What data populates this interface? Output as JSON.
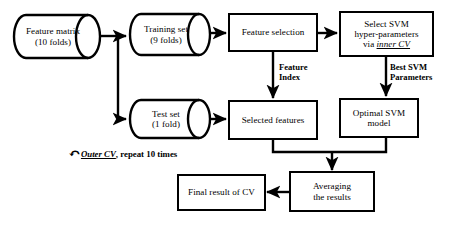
{
  "diagram": {
    "stroke_color": "#000000",
    "background_color": "#ffffff",
    "nodes": {
      "feature_matrix": {
        "line1": "Feature matrix",
        "line2": "(10 folds)",
        "shape": "cylinder"
      },
      "training_set": {
        "line1": "Training set",
        "line2": "(9 folds)",
        "shape": "cylinder"
      },
      "test_set": {
        "line1": "Test set",
        "line2": "(1 fold)",
        "shape": "cylinder"
      },
      "feature_selection": {
        "line1": "Feature selection",
        "shape": "rectangle"
      },
      "select_svm": {
        "line1": "Select SVM",
        "line2": "hyper-parameters",
        "line3_prefix": "via ",
        "line3_emphasis": "inner CV",
        "shape": "rectangle"
      },
      "selected_features": {
        "line1": "Selected  features",
        "shape": "rectangle"
      },
      "optimal_model": {
        "line1": "Optimal SVM",
        "line2": "model",
        "shape": "rectangle"
      },
      "averaging": {
        "line1": "Averaging",
        "line2": "the results",
        "shape": "rectangle"
      },
      "final_result": {
        "line1": "Final result of CV",
        "shape": "rectangle"
      }
    },
    "edge_labels": {
      "feature_index": {
        "line1": "Feature",
        "line2": "Index"
      },
      "best_params": {
        "line1": "Best  SVM",
        "line2": "Parameters"
      }
    },
    "loop_note": {
      "glyph": "↶",
      "emphasis": "Outer CV",
      "rest": ", repeat 10 times"
    }
  }
}
